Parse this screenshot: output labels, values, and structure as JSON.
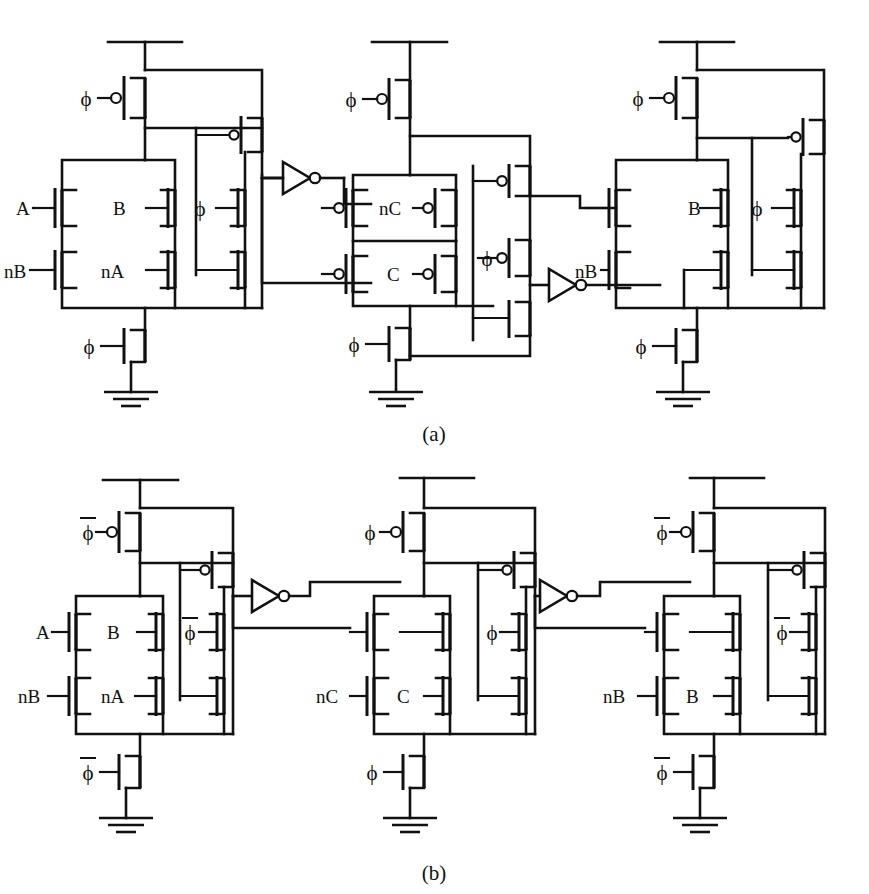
{
  "figure": {
    "line_color": "#111111",
    "background_color": "#ffffff",
    "captions": [
      {
        "id": "caption-a",
        "text": "(a)",
        "x": 420,
        "y": 441
      },
      {
        "id": "caption-b",
        "text": "(b)",
        "x": 420,
        "y": 880
      }
    ]
  },
  "symbols": {
    "phi": "ϕ",
    "phi_bar": "ϕ",
    "vdd": "vdd-rail",
    "gnd": "ground-symbol",
    "inverter": "inverter-triangle",
    "nmos": "nmos-transistor",
    "pmos": "pmos-transistor"
  },
  "panels": [
    {
      "id": "panel-a",
      "caption": "(a)",
      "clock_style": "phi",
      "stages": [
        {
          "id": "a-stage-1",
          "type": "nmos-dynamic-gate",
          "precharge_clock": "ϕ",
          "foot_clock": "ϕ",
          "keeper_clock": "ϕ",
          "inputs": [
            "A",
            "B",
            "nB",
            "nA"
          ],
          "input_labels": [
            {
              "name": "A",
              "x": 16,
              "y": 206
            },
            {
              "name": "B",
              "x": 110,
              "y": 206
            },
            {
              "name": "nB",
              "x": 10,
              "y": 274
            },
            {
              "name": "nA",
              "x": 104,
              "y": 274
            },
            {
              "name": "ϕ",
              "x": 181,
              "y": 208
            }
          ]
        },
        {
          "id": "a-stage-2",
          "type": "pmos-dynamic-gate",
          "precharge_clock": "ϕ",
          "foot_clock": "ϕ",
          "keeper_clock": "ϕ",
          "inputs": [
            "nC",
            "C"
          ],
          "input_labels": [
            {
              "name": "nC",
              "x": 381,
              "y": 196
            },
            {
              "name": "C",
              "x": 387,
              "y": 267
            },
            {
              "name": "ϕ",
              "x": 483,
              "y": 261
            }
          ]
        },
        {
          "id": "a-stage-3",
          "type": "nmos-dynamic-gate",
          "precharge_clock": "ϕ",
          "foot_clock": "ϕ",
          "keeper_clock": "ϕ",
          "inputs": [
            "B",
            "nB"
          ],
          "input_labels": [
            {
              "name": "B",
              "x": 693,
              "y": 206
            },
            {
              "name": "nB",
              "x": 581,
              "y": 274
            },
            {
              "name": "ϕ",
              "x": 775,
              "y": 208
            }
          ]
        }
      ],
      "clock_labels": [
        {
          "name": "ϕ",
          "x": 83,
          "y": 104,
          "bar": false
        },
        {
          "name": "ϕ",
          "x": 83,
          "y": 319,
          "bar": false
        },
        {
          "name": "ϕ",
          "x": 346,
          "y": 104,
          "bar": false
        },
        {
          "name": "ϕ",
          "x": 346,
          "y": 328,
          "bar": false
        },
        {
          "name": "ϕ",
          "x": 633,
          "y": 104,
          "bar": false
        },
        {
          "name": "ϕ",
          "x": 633,
          "y": 319,
          "bar": false
        }
      ],
      "inverters": [
        {
          "id": "a-inv-1",
          "x": 283,
          "y": 177
        },
        {
          "id": "a-inv-2",
          "x": 549,
          "y": 285
        }
      ]
    },
    {
      "id": "panel-b",
      "caption": "(b)",
      "clock_style": "phi-bar",
      "stages": [
        {
          "id": "b-stage-1",
          "type": "nmos-dynamic-gate",
          "precharge_clock": "ϕ̄",
          "foot_clock": "ϕ̄",
          "keeper_clock": "ϕ̄",
          "inputs": [
            "A",
            "B",
            "nB",
            "nA"
          ],
          "input_labels": [
            {
              "name": "A",
              "x": 40,
              "y": 633
            },
            {
              "name": "B",
              "x": 113,
              "y": 627
            },
            {
              "name": "nB",
              "x": 22,
              "y": 696
            },
            {
              "name": "nA",
              "x": 106,
              "y": 694
            },
            {
              "name": "ϕ",
              "x": 190,
              "y": 633,
              "bar": true
            }
          ]
        },
        {
          "id": "b-stage-2",
          "type": "nmos-dynamic-gate",
          "precharge_clock": "ϕ",
          "foot_clock": "ϕ",
          "keeper_clock": "ϕ",
          "inputs": [
            "nC",
            "C"
          ],
          "input_labels": [
            {
              "name": "nC",
              "x": 320,
              "y": 690
            },
            {
              "name": "C",
              "x": 400,
              "y": 690
            },
            {
              "name": "ϕ",
              "x": 490,
              "y": 622
            }
          ]
        },
        {
          "id": "b-stage-3",
          "type": "nmos-dynamic-gate",
          "precharge_clock": "ϕ̄",
          "foot_clock": "ϕ̄",
          "keeper_clock": "ϕ̄",
          "inputs": [
            "nB",
            "B"
          ],
          "input_labels": [
            {
              "name": "nB",
              "x": 607,
              "y": 687
            },
            {
              "name": "B",
              "x": 690,
              "y": 685
            },
            {
              "name": "ϕ",
              "x": 775,
              "y": 622,
              "bar": true
            }
          ]
        }
      ],
      "clock_labels": [
        {
          "name": "ϕ",
          "x": 85,
          "y": 538,
          "bar": true
        },
        {
          "name": "ϕ",
          "x": 84,
          "y": 763,
          "bar": true
        },
        {
          "name": "ϕ",
          "x": 390,
          "y": 532,
          "bar": false
        },
        {
          "name": "ϕ",
          "x": 389,
          "y": 767,
          "bar": false
        },
        {
          "name": "ϕ",
          "x": 675,
          "y": 538,
          "bar": true
        },
        {
          "name": "ϕ",
          "x": 674,
          "y": 763,
          "bar": true
        }
      ],
      "inverters": [
        {
          "id": "b-inv-1",
          "x": 252,
          "y": 596
        },
        {
          "id": "b-inv-2",
          "x": 540,
          "y": 596
        }
      ]
    }
  ]
}
